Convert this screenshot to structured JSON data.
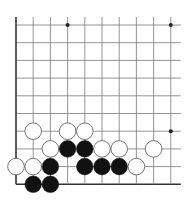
{
  "diagram": {
    "type": "go-board-fragment",
    "grid": {
      "columns": 10,
      "rows": 10,
      "origin_x": 16,
      "origin_y": 25,
      "spacing_x": 17.2,
      "spacing_y": 17.7,
      "right_extend": 10,
      "line_color": "#7a7a7a",
      "border_color": "#333333",
      "borders": [
        "left",
        "bottom"
      ]
    },
    "star_points": [
      {
        "col": 3,
        "row": 0
      },
      {
        "col": 9,
        "row": 0
      },
      {
        "col": 9,
        "row": 6
      }
    ],
    "stones": [
      {
        "color": "white",
        "col": 1,
        "row": 6
      },
      {
        "color": "white",
        "col": 3,
        "row": 6
      },
      {
        "color": "white",
        "col": 4,
        "row": 6
      },
      {
        "color": "white",
        "col": 2,
        "row": 7
      },
      {
        "color": "black",
        "col": 3,
        "row": 7
      },
      {
        "color": "black",
        "col": 4,
        "row": 7
      },
      {
        "color": "white",
        "col": 5,
        "row": 7
      },
      {
        "color": "white",
        "col": 6,
        "row": 7
      },
      {
        "color": "white",
        "col": 8,
        "row": 7
      },
      {
        "color": "white",
        "col": 0,
        "row": 8
      },
      {
        "color": "white",
        "col": 1,
        "row": 8
      },
      {
        "color": "black",
        "col": 2,
        "row": 8
      },
      {
        "color": "black",
        "col": 4,
        "row": 8
      },
      {
        "color": "black",
        "col": 5,
        "row": 8
      },
      {
        "color": "black",
        "col": 6,
        "row": 8
      },
      {
        "color": "white",
        "col": 7,
        "row": 8
      },
      {
        "color": "black",
        "col": 1,
        "row": 9
      },
      {
        "color": "black",
        "col": 2,
        "row": 9
      }
    ],
    "colors": {
      "black_stone": "#111111",
      "white_stone": "#ffffff",
      "white_stone_outline": "#555555",
      "star_point": "#222222"
    }
  }
}
